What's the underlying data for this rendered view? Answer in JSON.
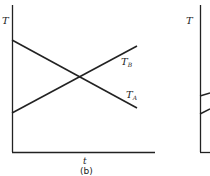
{
  "figure": {
    "panel_b": {
      "y_axis_label": "T",
      "x_axis_label": "t",
      "caption": "(b)",
      "lines": [
        {
          "name": "T_B",
          "label_main": "T",
          "label_sub": "B",
          "from": [
            12,
            113
          ],
          "to": [
            137,
            46
          ]
        },
        {
          "name": "T_A",
          "label_main": "T",
          "label_sub": "A",
          "from": [
            12,
            40
          ],
          "to": [
            137,
            108
          ]
        }
      ]
    },
    "panel_c_partial": {
      "y_axis_label": "T"
    }
  }
}
